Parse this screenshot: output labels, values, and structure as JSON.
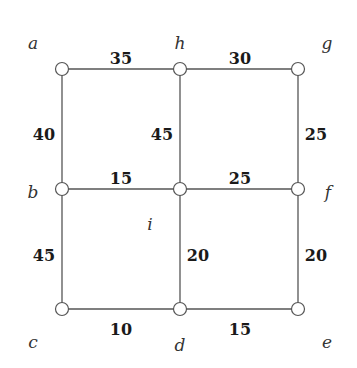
{
  "graph": {
    "nodes": [
      {
        "id": "a",
        "label": "a",
        "x": 62,
        "y": 69,
        "lx": 33,
        "ly": 44
      },
      {
        "id": "h",
        "label": "h",
        "x": 180,
        "y": 69,
        "lx": 180,
        "ly": 44
      },
      {
        "id": "g",
        "label": "g",
        "x": 298,
        "y": 69,
        "lx": 327,
        "ly": 44
      },
      {
        "id": "b",
        "label": "b",
        "x": 62,
        "y": 189,
        "lx": 33,
        "ly": 193
      },
      {
        "id": "i",
        "label": "i",
        "x": 180,
        "y": 189,
        "lx": 150,
        "ly": 225
      },
      {
        "id": "f",
        "label": "f",
        "x": 298,
        "y": 189,
        "lx": 328,
        "ly": 193
      },
      {
        "id": "c",
        "label": "c",
        "x": 62,
        "y": 309,
        "lx": 33,
        "ly": 343
      },
      {
        "id": "d",
        "label": "d",
        "x": 180,
        "y": 309,
        "lx": 180,
        "ly": 346
      },
      {
        "id": "e",
        "label": "e",
        "x": 298,
        "y": 309,
        "lx": 327,
        "ly": 343
      }
    ],
    "edges": [
      {
        "from": "a",
        "to": "h",
        "weight": "35",
        "wx": 121,
        "wy": 59
      },
      {
        "from": "h",
        "to": "g",
        "weight": "30",
        "wx": 240,
        "wy": 59
      },
      {
        "from": "a",
        "to": "b",
        "weight": "40",
        "wx": 44,
        "wy": 135
      },
      {
        "from": "h",
        "to": "i",
        "weight": "45",
        "wx": 162,
        "wy": 135
      },
      {
        "from": "g",
        "to": "f",
        "weight": "25",
        "wx": 316,
        "wy": 135
      },
      {
        "from": "b",
        "to": "i",
        "weight": "15",
        "wx": 121,
        "wy": 179
      },
      {
        "from": "i",
        "to": "f",
        "weight": "25",
        "wx": 240,
        "wy": 179
      },
      {
        "from": "b",
        "to": "c",
        "weight": "45",
        "wx": 44,
        "wy": 256
      },
      {
        "from": "i",
        "to": "d",
        "weight": "20",
        "wx": 198,
        "wy": 256
      },
      {
        "from": "f",
        "to": "e",
        "weight": "20",
        "wx": 316,
        "wy": 256
      },
      {
        "from": "c",
        "to": "d",
        "weight": "10",
        "wx": 121,
        "wy": 330
      },
      {
        "from": "d",
        "to": "e",
        "weight": "15",
        "wx": 240,
        "wy": 330
      }
    ]
  }
}
